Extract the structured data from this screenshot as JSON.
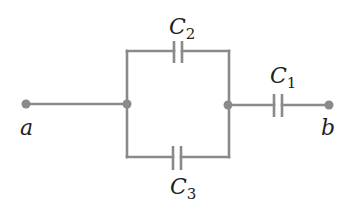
{
  "diagram": {
    "type": "circuit",
    "colors": {
      "wire": "#8a8a8a",
      "text": "#222222",
      "background": "#ffffff"
    },
    "terminals": {
      "a": {
        "label": "a"
      },
      "b": {
        "label": "b"
      }
    },
    "capacitors": {
      "c1": {
        "letter": "C",
        "subscript": "1"
      },
      "c2": {
        "letter": "C",
        "subscript": "2"
      },
      "c3": {
        "letter": "C",
        "subscript": "3"
      }
    },
    "connections": [
      "a - left junction",
      "left junction - C2 - right junction",
      "left junction - C3 - right junction",
      "right junction - C1 - b"
    ]
  }
}
